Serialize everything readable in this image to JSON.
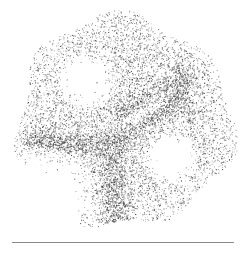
{
  "figure": {
    "kind": "stipple-dot-image",
    "width": 247,
    "height": 255,
    "dot_color": "#3a3a3a",
    "background": "#ffffff",
    "dot_count": 9000,
    "seed": 1337,
    "blob": {
      "cx": 123,
      "cy": 122,
      "rx": 108,
      "ry": 106,
      "edge_noise": 9
    },
    "voids": [
      {
        "name": "upper-left-void",
        "cx": 85,
        "cy": 80,
        "rx": 30,
        "ry": 30,
        "rot": 0
      },
      {
        "name": "center-lens-void",
        "cx": 152,
        "cy": 104,
        "rx": 28,
        "ry": 11,
        "rot": -40
      },
      {
        "name": "lower-right-void",
        "cx": 170,
        "cy": 158,
        "rx": 28,
        "ry": 27,
        "rot": 0
      },
      {
        "name": "small-left-void",
        "cx": 97,
        "cy": 148,
        "rx": 9,
        "ry": 4,
        "rot": 20
      },
      {
        "name": "lower-left-empty",
        "cx": 45,
        "cy": 195,
        "rx": 55,
        "ry": 50,
        "rot": 0
      }
    ],
    "ridges": [
      {
        "name": "horizontal-ridge",
        "x1": 30,
        "y1": 140,
        "x2": 110,
        "y2": 148,
        "w": 6,
        "weight": 3
      },
      {
        "name": "lens-lower-edge",
        "x1": 110,
        "y1": 148,
        "x2": 180,
        "y2": 95,
        "w": 5,
        "weight": 3
      },
      {
        "name": "lens-upper-edge",
        "x1": 120,
        "y1": 112,
        "x2": 185,
        "y2": 80,
        "w": 5,
        "weight": 2.5
      },
      {
        "name": "vertical-stem",
        "x1": 112,
        "y1": 150,
        "x2": 118,
        "y2": 225,
        "w": 8,
        "weight": 2.6
      },
      {
        "name": "upper-right-ridge",
        "x1": 178,
        "y1": 70,
        "x2": 190,
        "y2": 120,
        "w": 4,
        "weight": 1.6
      }
    ],
    "rule": {
      "x": 12,
      "y": 242,
      "width": 222,
      "color": "#8a8a8a"
    }
  }
}
